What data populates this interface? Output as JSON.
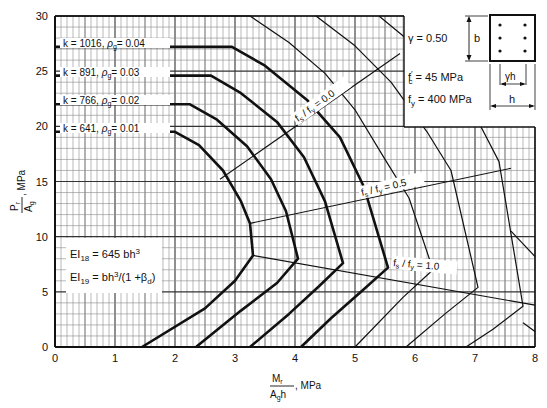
{
  "chart_data": {
    "type": "line",
    "title": "",
    "xlabel": "Mr / (Ag h), MPa",
    "ylabel": "Pr / Ag, MPa",
    "xlim": [
      0,
      8
    ],
    "ylim": [
      0,
      30
    ],
    "x_ticks": [
      "0",
      "1",
      "2",
      "3",
      "4",
      "5",
      "6",
      "7",
      "8"
    ],
    "y_ticks": [
      "0",
      "5",
      "10",
      "15",
      "20",
      "25",
      "30"
    ],
    "grid": true,
    "series": [
      {
        "name": "k = 641, ρg = 0.01",
        "k": "641",
        "rho": "0.01",
        "style": "thick",
        "points": [
          [
            0,
            19.5
          ],
          [
            2.0,
            19.5
          ],
          [
            2.4,
            18.3
          ],
          [
            2.8,
            16.0
          ],
          [
            3.1,
            13.2
          ],
          [
            3.25,
            11.2
          ],
          [
            3.3,
            8.3
          ],
          [
            3.0,
            6.0
          ],
          [
            2.5,
            3.5
          ],
          [
            1.45,
            0
          ]
        ]
      },
      {
        "name": "k = 766, ρg = 0.02",
        "k": "766",
        "rho": "0.02",
        "style": "thick",
        "points": [
          [
            0,
            22.0
          ],
          [
            2.25,
            22.0
          ],
          [
            2.7,
            20.6
          ],
          [
            3.2,
            18.2
          ],
          [
            3.6,
            15.2
          ],
          [
            3.85,
            12.3
          ],
          [
            4.05,
            8.0
          ],
          [
            3.7,
            5.8
          ],
          [
            3.1,
            3.3
          ],
          [
            2.35,
            0
          ]
        ]
      },
      {
        "name": "k = 891, ρg = 0.03",
        "k": "891",
        "rho": "0.03",
        "style": "thick",
        "points": [
          [
            0,
            24.6
          ],
          [
            2.6,
            24.6
          ],
          [
            3.1,
            23.0
          ],
          [
            3.7,
            20.4
          ],
          [
            4.15,
            17.2
          ],
          [
            4.5,
            13.2
          ],
          [
            4.8,
            7.6
          ],
          [
            4.4,
            5.5
          ],
          [
            3.9,
            3.0
          ],
          [
            3.25,
            0
          ]
        ]
      },
      {
        "name": "k = 1016, ρg = 0.04",
        "k": "1016",
        "rho": "0.04",
        "style": "thick",
        "points": [
          [
            0,
            27.2
          ],
          [
            2.95,
            27.2
          ],
          [
            3.5,
            25.5
          ],
          [
            4.2,
            22.4
          ],
          [
            4.75,
            19.0
          ],
          [
            5.15,
            14.5
          ],
          [
            5.55,
            7.2
          ],
          [
            5.1,
            5.0
          ],
          [
            4.6,
            2.6
          ],
          [
            4.1,
            0
          ]
        ]
      },
      {
        "name": "outer-1",
        "style": "thin",
        "points": [
          [
            0,
            30
          ],
          [
            3.25,
            30
          ],
          [
            3.9,
            27.6
          ],
          [
            4.5,
            24.8
          ],
          [
            5.0,
            21.5
          ],
          [
            5.5,
            17.0
          ],
          [
            5.9,
            13.5
          ],
          [
            6.3,
            7.0
          ],
          [
            5.8,
            4.5
          ],
          [
            5.0,
            0
          ]
        ]
      },
      {
        "name": "outer-2",
        "style": "thin",
        "points": [
          [
            4.35,
            30
          ],
          [
            5.0,
            27.3
          ],
          [
            5.6,
            24.0
          ],
          [
            6.2,
            19.5
          ],
          [
            6.6,
            16.0
          ],
          [
            7.05,
            5.4
          ],
          [
            6.5,
            3.0
          ],
          [
            5.85,
            0
          ]
        ]
      },
      {
        "name": "outer-3",
        "style": "thin",
        "points": [
          [
            5.4,
            30
          ],
          [
            6.0,
            27.3
          ],
          [
            6.6,
            24.0
          ],
          [
            7.0,
            21.0
          ],
          [
            7.4,
            16.8
          ],
          [
            7.8,
            3.7
          ],
          [
            7.3,
            1.6
          ],
          [
            6.85,
            0
          ]
        ]
      },
      {
        "name": "outer-4",
        "style": "thin",
        "points": [
          [
            7.6,
            10.5
          ],
          [
            8.0,
            8.2
          ]
        ]
      },
      {
        "name": "outer-5",
        "style": "thin",
        "points": [
          [
            7.8,
            2.2
          ],
          [
            8.0,
            1.4
          ]
        ]
      }
    ],
    "strain_lines": [
      {
        "label_prefix": "fs / fy",
        "value": "0.0",
        "points": [
          [
            2.75,
            15.2
          ],
          [
            5.75,
            26.6
          ]
        ]
      },
      {
        "label_prefix": "fs / fy",
        "value": "0.5",
        "points": [
          [
            3.25,
            11.2
          ],
          [
            7.6,
            16.2
          ]
        ]
      },
      {
        "label_prefix": "fs / fy",
        "value": "1.0",
        "points": [
          [
            3.3,
            8.3
          ],
          [
            8.0,
            3.8
          ]
        ]
      }
    ],
    "annotations": {
      "gamma": "γ = 0.50",
      "fc": "f′c = 45 MPa",
      "fy": "fy = 400 MPa",
      "ei18": "EI18 = 645 bh3",
      "ei19": "EI19 = bh3/(1 + βd)"
    }
  },
  "labels": {
    "k_labels": [
      {
        "k_text": "k = 1016,",
        "rho_text": "ρ",
        "rho_sub": "g",
        "rho_val": "= 0.04"
      },
      {
        "k_text": "k =  891,",
        "rho_text": "ρ",
        "rho_sub": "g",
        "rho_val": "= 0.03"
      },
      {
        "k_text": "k =  766,",
        "rho_text": "ρ",
        "rho_sub": "g",
        "rho_val": "= 0.02"
      },
      {
        "k_text": "k =  641,",
        "rho_text": "ρ",
        "rho_sub": "g",
        "rho_val": "= 0.01"
      }
    ],
    "fsfy": [
      {
        "f": "f",
        "s": "s",
        "mid": " / f",
        "y": "y",
        "val": " = 0.0"
      },
      {
        "f": "f",
        "s": "s",
        "mid": " / f",
        "y": "y",
        "val": " = 0.5"
      },
      {
        "f": "f",
        "s": "s",
        "mid": " / f",
        "y": "y",
        "val": " = 1.0"
      }
    ],
    "inset": {
      "gamma": "γ  =  0.50",
      "fc_f": "f",
      "fc_sub": "c",
      "fc_prime": "′",
      "fc_val": " =   45  MPa",
      "fy_f": "f",
      "fy_sub": "y",
      "fy_val": " =  400  MPa",
      "b": "b",
      "gh": "γh",
      "h": "h"
    },
    "ei": {
      "ei18_a": "EI",
      "ei18_sub": "18",
      "ei18_b": " = 645 bh",
      "ei18_sup": "3",
      "ei19_a": "EI",
      "ei19_sub": "19",
      "ei19_b": " = bh",
      "ei19_sup": "3",
      "ei19_c": "/(1 +β",
      "ei19_sub2": "d",
      "ei19_d": ")"
    },
    "xaxis": {
      "num": "M",
      "num_sub": "r",
      "den": "A",
      "den_sub": "g",
      "den_tail": "h",
      "unit": ", MPa"
    },
    "yaxis": {
      "num": "P",
      "num_sub": "r",
      "den": "A",
      "den_sub": "g",
      "unit": ", MPa"
    }
  }
}
